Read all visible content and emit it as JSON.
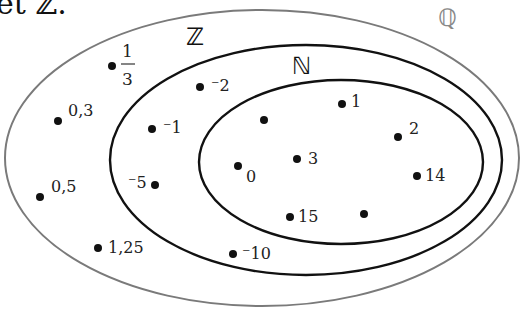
{
  "caption_fragment": "et ℤ.",
  "sets": {
    "Q": {
      "label": "ℚ",
      "stroke": "#7a7a7a"
    },
    "Z": {
      "label": "ℤ",
      "stroke": "#111111"
    },
    "N": {
      "label": "ℕ",
      "stroke": "#111111"
    }
  },
  "points": {
    "q_one_third": {
      "num": "1",
      "den": "3"
    },
    "q_0_3": "0,3",
    "q_0_5": "0,5",
    "q_1_25": "1,25",
    "z_m2": "⁻2",
    "z_m1": "⁻1",
    "z_m5": "⁻5",
    "z_m10": "⁻10",
    "n_0": "0",
    "n_1": "1",
    "n_2": "2",
    "n_3": "3",
    "n_14": "14",
    "n_15": "15",
    "n_unlabeled_a": "",
    "n_unlabeled_b": ""
  }
}
